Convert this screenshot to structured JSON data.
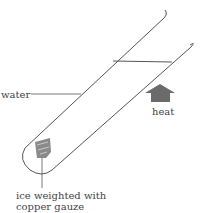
{
  "diagram": {
    "labels": {
      "water": "water",
      "heat": "heat",
      "ice_line1": "ice weighted with",
      "ice_line2": "copper gauze"
    },
    "colors": {
      "outline": "#555555",
      "arrow": "#6b6b6b",
      "gauze": "#8a8a8a"
    }
  }
}
